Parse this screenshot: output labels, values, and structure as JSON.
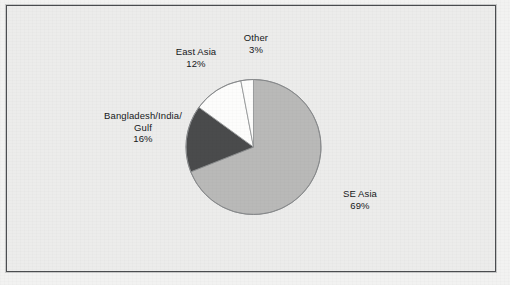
{
  "figure": {
    "background_color": "#ececeb",
    "frame_color": "#4b4d50"
  },
  "chart_data": {
    "type": "pie",
    "title": "",
    "subtitle": "",
    "xlabel": "",
    "ylabel": "",
    "legend_position": "none",
    "grid": false,
    "units": "percent",
    "start_angle_deg": 0,
    "direction": "clockwise",
    "categories": [
      "SE Asia",
      "Bangladesh/India/Gulf",
      "East Asia",
      "Other"
    ],
    "values": [
      69,
      16,
      12,
      3
    ],
    "total": 100,
    "slices": [
      {
        "label": "SE Asia",
        "label_line1": "SE Asia",
        "label_line2": "69%",
        "value": 69,
        "value_text": "69%",
        "color": "#b9b9b8",
        "start_deg": 0,
        "end_deg": 248.4
      },
      {
        "label": "Bangladesh/India/Gulf",
        "label_line1": "Bangladesh/India/",
        "label_line2": "Gulf",
        "label_line3": "16%",
        "value": 16,
        "value_text": "16%",
        "color": "#4a4b4c",
        "start_deg": 248.4,
        "end_deg": 306.0
      },
      {
        "label": "East Asia",
        "label_line1": "East Asia",
        "label_line2": "12%",
        "value": 12,
        "value_text": "12%",
        "color": "#fdfdfc",
        "start_deg": 306.0,
        "end_deg": 349.2
      },
      {
        "label": "Other",
        "label_line1": "Other",
        "label_line2": "3%",
        "value": 3,
        "value_text": "3%",
        "color": "#fdfdfc",
        "start_deg": 349.2,
        "end_deg": 360.0
      }
    ]
  }
}
